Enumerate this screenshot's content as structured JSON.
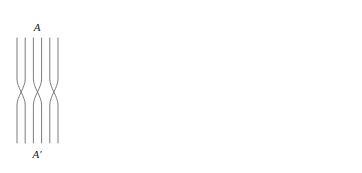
{
  "figure": {
    "kind": "braid-diagram-with-axis",
    "width": 362,
    "height": 173,
    "background": "#ffffff",
    "stroke_color": "#6e6e6e",
    "axis_color": "#111111",
    "guide_color": "#333333"
  },
  "braids": [
    {
      "id": "A",
      "top_label": "A",
      "bottom_label": "A′",
      "strand_count": 6,
      "crossing_count": 3,
      "x_left": 17,
      "x_right": 58,
      "y_top": 38,
      "y_bottom": 143,
      "cross_y_center": 92,
      "cross_half_height": 13,
      "crossing_pairs": [
        [
          0,
          1
        ],
        [
          2,
          3
        ],
        [
          4,
          5
        ]
      ],
      "top_label_x": 37,
      "top_label_y": 31,
      "bottom_label_x": 37,
      "bottom_label_y": 158
    },
    {
      "id": "B",
      "top_label": "B",
      "bottom_label": "B′",
      "strand_count": 5,
      "crossing_count": 0,
      "x_left": 83,
      "x_right": 121,
      "y_top": 38,
      "y_bottom": 143,
      "cross_y_center": 92,
      "cross_half_height": 13,
      "crossing_pairs": [],
      "top_label_x": 102,
      "top_label_y": 31,
      "bottom_label_x": 102,
      "bottom_label_y": 158
    },
    {
      "id": "C",
      "top_label": "C",
      "bottom_label": "C′",
      "strand_count": 6,
      "crossing_count": 4,
      "x_left": 303,
      "x_right": 352,
      "y_top": 38,
      "y_bottom": 143,
      "cross_y_center": 92,
      "cross_half_height": 13,
      "crossing_pairs": [
        [
          0,
          1
        ],
        [
          1,
          2
        ],
        [
          3,
          4
        ],
        [
          4,
          5
        ]
      ],
      "top_label_x": 327,
      "top_label_y": 31,
      "bottom_label_x": 327,
      "bottom_label_y": 158
    }
  ],
  "axes": {
    "x_axis": {
      "label": "x",
      "label_x": 271,
      "label_y": 95,
      "y": 90,
      "x_start": 145,
      "x_end": 258,
      "arrow_tip_x": 264
    },
    "y_axis": {
      "label": "y",
      "label_x": 170,
      "label_y": 14,
      "x": 166,
      "y_start": 143,
      "y_end": 26,
      "arrow_tip_y": 20
    },
    "origin": {
      "x": 166,
      "y": 90
    }
  },
  "guides": [
    {
      "id": "A",
      "top_label": "A",
      "bottom_label": "A′",
      "x": 191,
      "y_top": 36,
      "y_bottom": 146,
      "top_label_y": 33,
      "bottom_label_y": 158
    },
    {
      "id": "B",
      "top_label": "B",
      "bottom_label": "B′",
      "x": 216,
      "y_top": 36,
      "y_bottom": 146,
      "top_label_y": 33,
      "bottom_label_y": 158
    },
    {
      "id": "C",
      "top_label": "C",
      "bottom_label": "C′",
      "x": 240,
      "y_top": 36,
      "y_bottom": 146,
      "top_label_y": 33,
      "bottom_label_y": 158
    }
  ],
  "points": [
    {
      "label": "1",
      "x": 203,
      "y": 90,
      "label_x": 203,
      "label_y": 103,
      "radius": 2.1
    },
    {
      "label": "2",
      "x": 228,
      "y": 90,
      "label_x": 228,
      "label_y": 103,
      "radius": 2.1
    }
  ]
}
